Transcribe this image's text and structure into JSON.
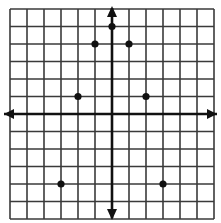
{
  "chart_data": {
    "type": "scatter",
    "title": "",
    "xlabel": "",
    "ylabel": "",
    "grid": true,
    "xlim": [
      -6,
      6
    ],
    "ylim": [
      -6,
      6
    ],
    "axes_arrows": true,
    "points": [
      {
        "x": 0,
        "y": 5
      },
      {
        "x": -1,
        "y": 4
      },
      {
        "x": 1,
        "y": 4
      },
      {
        "x": -2,
        "y": 1
      },
      {
        "x": 2,
        "y": 1
      },
      {
        "x": -3,
        "y": -4
      },
      {
        "x": 3,
        "y": -4
      }
    ]
  },
  "style": {
    "grid_color": "#3a3a3a",
    "axis_color": "#111111",
    "point_color": "#111111",
    "background": "#ffffff"
  }
}
